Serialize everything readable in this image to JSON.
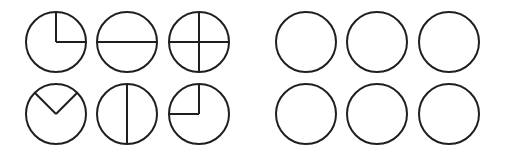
{
  "figure": {
    "background_color": "#ffffff",
    "stroke_color": "#1f1f1f",
    "stroke_width": 2,
    "circle_radius": 30,
    "canvas": {
      "width": 511,
      "height": 155
    },
    "grid": {
      "rows": 2,
      "columns": 6
    },
    "row_centers_y": [
      42,
      114
    ],
    "column_centers_x": [
      56,
      127,
      199,
      306,
      377,
      449
    ],
    "groups": [
      {
        "name": "divided-circles",
        "columns": [
          0,
          1,
          2
        ],
        "description": "circles containing radius and diameter dividing lines"
      },
      {
        "name": "blank-circles",
        "columns": [
          3,
          4,
          5
        ],
        "description": "plain empty circles with no dividing lines"
      }
    ]
  },
  "chart_data": {
    "type": "diagram",
    "xlabel": "",
    "ylabel": "",
    "shape": "circle",
    "rows": 2,
    "columns": 6,
    "radius": 30,
    "stroke_color": "#1f1f1f",
    "stroke_width": 2,
    "items": [
      {
        "id": "circle-r1c1",
        "row": 1,
        "column": 1,
        "cx": 56,
        "cy": 42,
        "filled": false,
        "divider_count": 2,
        "fraction_label": "one quarter sector, top-right",
        "dividers": [
          {
            "type": "radius",
            "angle_deg": 90,
            "name": "radius-up"
          },
          {
            "type": "radius",
            "angle_deg": 0,
            "name": "radius-right"
          }
        ]
      },
      {
        "id": "circle-r1c2",
        "row": 1,
        "column": 2,
        "cx": 127,
        "cy": 42,
        "filled": false,
        "divider_count": 1,
        "fraction_label": "halves, horizontal split",
        "dividers": [
          {
            "type": "diameter",
            "angle_deg": 0,
            "name": "horizontal-diameter"
          }
        ]
      },
      {
        "id": "circle-r1c3",
        "row": 1,
        "column": 3,
        "cx": 199,
        "cy": 42,
        "filled": false,
        "divider_count": 2,
        "fraction_label": "quarters, cross split",
        "dividers": [
          {
            "type": "diameter",
            "angle_deg": 0,
            "name": "horizontal-diameter"
          },
          {
            "type": "diameter",
            "angle_deg": 90,
            "name": "vertical-diameter"
          }
        ]
      },
      {
        "id": "circle-r1c4",
        "row": 1,
        "column": 4,
        "cx": 306,
        "cy": 42,
        "filled": false,
        "divider_count": 0,
        "fraction_label": "blank circle",
        "dividers": []
      },
      {
        "id": "circle-r1c5",
        "row": 1,
        "column": 5,
        "cx": 377,
        "cy": 42,
        "filled": false,
        "divider_count": 0,
        "fraction_label": "blank circle",
        "dividers": []
      },
      {
        "id": "circle-r1c6",
        "row": 1,
        "column": 6,
        "cx": 449,
        "cy": 42,
        "filled": false,
        "divider_count": 0,
        "fraction_label": "blank circle",
        "dividers": []
      },
      {
        "id": "circle-r2c1",
        "row": 2,
        "column": 1,
        "cx": 56,
        "cy": 114,
        "filled": false,
        "divider_count": 2,
        "fraction_label": "wedge sector at top, V shape",
        "dividers": [
          {
            "type": "radius",
            "angle_deg": 135,
            "name": "radius-up-left"
          },
          {
            "type": "radius",
            "angle_deg": 45,
            "name": "radius-up-right"
          }
        ]
      },
      {
        "id": "circle-r2c2",
        "row": 2,
        "column": 2,
        "cx": 127,
        "cy": 114,
        "filled": false,
        "divider_count": 1,
        "fraction_label": "halves, vertical split",
        "dividers": [
          {
            "type": "diameter",
            "angle_deg": 90,
            "name": "vertical-diameter"
          }
        ]
      },
      {
        "id": "circle-r2c3",
        "row": 2,
        "column": 3,
        "cx": 199,
        "cy": 114,
        "filled": false,
        "divider_count": 2,
        "fraction_label": "one quarter sector, top-left",
        "dividers": [
          {
            "type": "radius",
            "angle_deg": 90,
            "name": "radius-up"
          },
          {
            "type": "radius",
            "angle_deg": 180,
            "name": "radius-left"
          }
        ]
      },
      {
        "id": "circle-r2c4",
        "row": 2,
        "column": 4,
        "cx": 306,
        "cy": 114,
        "filled": false,
        "divider_count": 0,
        "fraction_label": "blank circle",
        "dividers": []
      },
      {
        "id": "circle-r2c5",
        "row": 2,
        "column": 5,
        "cx": 377,
        "cy": 114,
        "filled": false,
        "divider_count": 0,
        "fraction_label": "blank circle",
        "dividers": []
      },
      {
        "id": "circle-r2c6",
        "row": 2,
        "column": 6,
        "cx": 449,
        "cy": 114,
        "filled": false,
        "divider_count": 0,
        "fraction_label": "blank circle",
        "dividers": []
      }
    ]
  }
}
